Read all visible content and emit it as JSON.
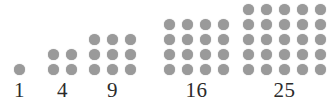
{
  "figure": {
    "background_color": "#ffffff",
    "dot_color": "#9a9a9a",
    "label_color": "#2b2b2b"
  },
  "chart_data": {
    "type": "scatter",
    "xlabel": "",
    "ylabel": "",
    "categories": [
      "1",
      "4",
      "9",
      "16",
      "25"
    ],
    "values": [
      1,
      4,
      9,
      16,
      25
    ],
    "series": [
      {
        "name": "Square numbers",
        "values": [
          1,
          4,
          9,
          16,
          25
        ]
      },
      {
        "name": "Side length (dots per row)",
        "values": [
          1,
          2,
          3,
          4,
          5
        ]
      }
    ],
    "annotations": [
      "1",
      "4",
      "9",
      "16",
      "25"
    ],
    "grid": false,
    "legend": "none"
  },
  "groups": [
    {
      "label": "1",
      "side": 1,
      "total": 1,
      "left": 14
    },
    {
      "label": "4",
      "side": 2,
      "total": 4,
      "left": 48
    },
    {
      "label": "9",
      "side": 3,
      "total": 9,
      "left": 89
    },
    {
      "label": "16",
      "side": 4,
      "total": 16,
      "left": 164
    },
    {
      "label": "25",
      "side": 5,
      "total": 25,
      "left": 243
    }
  ]
}
